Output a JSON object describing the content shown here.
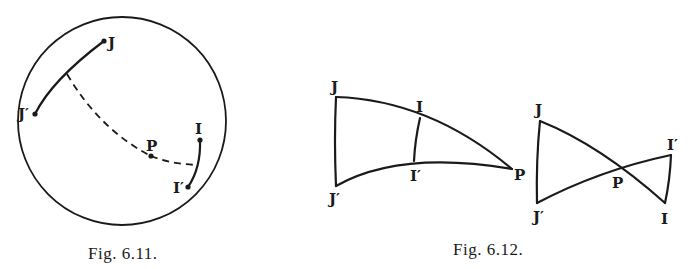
{
  "figures": [
    {
      "id": "fig-6-11",
      "caption": "Fig. 6.11.",
      "labels": {
        "J": "J",
        "J_prime": "J′",
        "P": "P",
        "I": "I",
        "I_prime": "I′"
      },
      "description": "Sphere (circle) with arc JJ′, arc II′, and dashed great-circle arc through P joining the two arcs"
    },
    {
      "id": "fig-6-12",
      "caption": "Fig. 6.12.",
      "left": {
        "labels": {
          "J": "J",
          "I": "I",
          "J_prime": "J′",
          "I_prime": "I′",
          "P": "P"
        }
      },
      "right": {
        "labels": {
          "J": "J",
          "I_prime": "I′",
          "P": "P",
          "J_prime": "J′",
          "I": "I"
        }
      }
    }
  ],
  "colors": {
    "ink": "#1a1a1a",
    "paper": "#ffffff"
  }
}
